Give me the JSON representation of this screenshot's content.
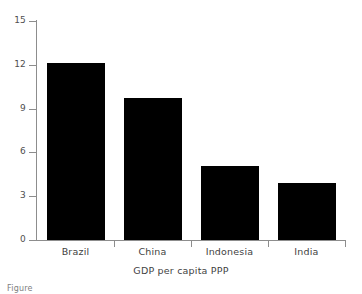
{
  "chart_data": {
    "type": "bar",
    "title": "",
    "subtitle": "",
    "xlabel": "GDP per capita PPP",
    "ylabel": "",
    "categories": [
      "Brazil",
      "China",
      "Indonesia",
      "India"
    ],
    "values": [
      12.1,
      9.7,
      5.1,
      3.9
    ],
    "series": [
      {
        "name": "GDP per capita PPP",
        "values": [
          12.1,
          9.7,
          5.1,
          3.9
        ]
      }
    ],
    "ylim": [
      0,
      15
    ],
    "yticks": [
      0,
      3,
      6,
      9,
      12,
      15
    ],
    "ytick_labels": [
      "0",
      "3",
      "6",
      "9",
      "12",
      "15"
    ],
    "grid": false,
    "legend": null,
    "legend_position": "none",
    "bar_color": "#000000",
    "axis_color": "#8d8d8d",
    "text_color": "#3f3f3f",
    "background": "#ffffff",
    "annotations": []
  },
  "figure": {
    "caption_fragment": "Figure"
  }
}
